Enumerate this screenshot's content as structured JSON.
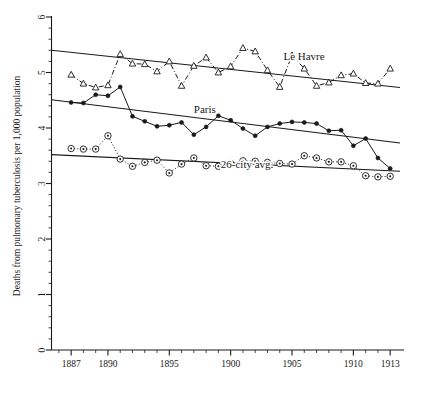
{
  "chart_data": {
    "type": "line",
    "title": "",
    "xlabel": "",
    "ylabel": "Deaths from pulmonary tuberculosis per 1,000 population",
    "xlim": [
      1885.4,
      1913.8
    ],
    "ylim": [
      0,
      6
    ],
    "grid": false,
    "legend": "inline-annotations",
    "x_tick_labels": [
      "1887",
      "1890",
      "1895",
      "1900",
      "1905",
      "1910",
      "1913"
    ],
    "x_tick_values": [
      1887,
      1890,
      1895,
      1900,
      1905,
      1910,
      1913
    ],
    "x_minor_tick_step": 1,
    "y_tick_labels": [
      "0",
      "1",
      "2",
      "3",
      "4",
      "5",
      "6"
    ],
    "y_tick_values": [
      0,
      1,
      2,
      3,
      4,
      5,
      6
    ],
    "y_minor_tick_step": 0.2,
    "series": [
      {
        "name": "Le Havre",
        "marker": "open-triangle",
        "linestyle": "dash-dot",
        "color": "#1a1a1a",
        "annotation": "Le Havre",
        "annotation_x": 1904.3,
        "annotation_y": 5.23,
        "x": [
          1887,
          1888,
          1889,
          1890,
          1891,
          1892,
          1893,
          1894,
          1895,
          1896,
          1897,
          1898,
          1899,
          1900,
          1901,
          1902,
          1903,
          1904,
          1905,
          1906,
          1907,
          1908,
          1909,
          1910,
          1911,
          1912,
          1913
        ],
        "y": [
          4.96,
          4.8,
          4.73,
          4.77,
          5.33,
          5.16,
          5.15,
          5.02,
          5.2,
          4.76,
          5.12,
          5.27,
          5.0,
          5.11,
          5.44,
          5.38,
          5.04,
          4.74,
          5.31,
          5.07,
          4.76,
          4.82,
          4.95,
          4.98,
          4.81,
          4.8,
          5.07
        ]
      },
      {
        "name": "Paris",
        "marker": "filled-circle",
        "linestyle": "solid",
        "color": "#1a1a1a",
        "annotation": "Paris",
        "annotation_x": 1897.0,
        "annotation_y": 4.27,
        "x": [
          1887,
          1888,
          1889,
          1890,
          1891,
          1892,
          1893,
          1894,
          1895,
          1896,
          1897,
          1898,
          1899,
          1900,
          1901,
          1902,
          1903,
          1904,
          1905,
          1906,
          1907,
          1908,
          1909,
          1910,
          1911,
          1912,
          1913
        ],
        "y": [
          4.46,
          4.45,
          4.6,
          4.58,
          4.74,
          4.21,
          4.12,
          4.03,
          4.05,
          4.1,
          3.88,
          4.02,
          4.22,
          4.14,
          3.99,
          3.86,
          4.02,
          4.08,
          4.11,
          4.1,
          4.08,
          3.95,
          3.96,
          3.68,
          3.81,
          3.46,
          3.27
        ]
      },
      {
        "name": "26-city avg.",
        "marker": "circled-dot",
        "linestyle": "dotted",
        "color": "#1a1a1a",
        "annotation": "26-city avg.",
        "annotation_x": 1899.2,
        "annotation_y": 3.28,
        "x": [
          1887,
          1888,
          1889,
          1890,
          1891,
          1892,
          1893,
          1894,
          1895,
          1896,
          1897,
          1898,
          1899,
          1900,
          1901,
          1902,
          1903,
          1904,
          1905,
          1906,
          1907,
          1908,
          1909,
          1910,
          1911,
          1912,
          1913
        ],
        "y": [
          3.63,
          3.62,
          3.62,
          3.86,
          3.44,
          3.31,
          3.38,
          3.42,
          3.19,
          3.35,
          3.46,
          3.32,
          3.31,
          3.36,
          3.41,
          3.4,
          3.38,
          3.36,
          3.35,
          3.5,
          3.46,
          3.39,
          3.39,
          3.32,
          3.14,
          3.12,
          3.13
        ]
      }
    ],
    "trendlines": [
      {
        "name": "Le Havre trend",
        "x0": 1885.4,
        "y0": 5.4,
        "x1": 1913.8,
        "y1": 4.73
      },
      {
        "name": "Paris trend",
        "x0": 1885.4,
        "y0": 4.51,
        "x1": 1913.8,
        "y1": 3.73
      },
      {
        "name": "26-city avg trend",
        "x0": 1885.4,
        "y0": 3.52,
        "x1": 1913.8,
        "y1": 3.22
      }
    ]
  }
}
